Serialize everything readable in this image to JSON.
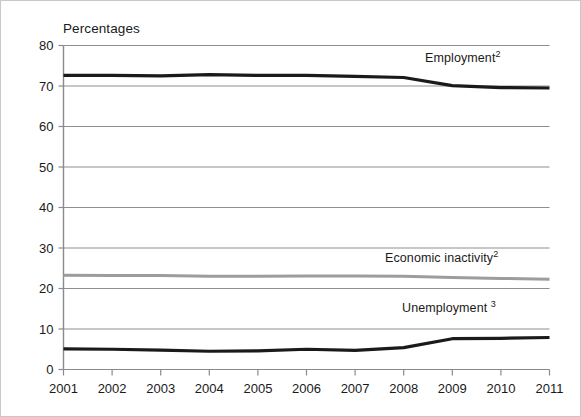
{
  "chart_data": {
    "type": "line",
    "title": "",
    "ylabel": "Percentages",
    "xlabel": "",
    "ylim": [
      0,
      80
    ],
    "ytick_step": 10,
    "grid": true,
    "legend_position": "inline-annotations",
    "x": [
      2001,
      2002,
      2003,
      2004,
      2005,
      2006,
      2007,
      2008,
      2009,
      2010,
      2011
    ],
    "xtick_labels": [
      "2001",
      "2002",
      "2003",
      "2004",
      "2005",
      "2006",
      "2007",
      "2008",
      "2009",
      "2010",
      "2011"
    ],
    "ytick_labels": [
      "0",
      "10",
      "20",
      "30",
      "40",
      "50",
      "60",
      "70",
      "80"
    ],
    "ytick_values": [
      0,
      10,
      20,
      30,
      40,
      50,
      60,
      70,
      80
    ],
    "series": [
      {
        "name": "Employment",
        "label_text": "Employment",
        "label_superscript": "2",
        "color": "#1a1a1a",
        "width": 3.2,
        "values": [
          72.6,
          72.6,
          72.5,
          72.8,
          72.6,
          72.6,
          72.4,
          72.1,
          70.1,
          69.6,
          69.5
        ]
      },
      {
        "name": "Economic inactivity",
        "label_text": "Economic inactivity",
        "label_superscript": "2",
        "color": "#9c9c9c",
        "width": 3.0,
        "values": [
          23.3,
          23.2,
          23.2,
          23.0,
          23.0,
          23.1,
          23.1,
          23.0,
          22.7,
          22.5,
          22.3
        ]
      },
      {
        "name": "Unemployment",
        "label_text": "Unemployment",
        "label_superscript": "3",
        "color": "#1a1a1a",
        "width": 3.2,
        "values": [
          5.1,
          5.0,
          4.8,
          4.5,
          4.6,
          5.0,
          4.7,
          5.4,
          7.6,
          7.7,
          7.9
        ]
      }
    ]
  }
}
